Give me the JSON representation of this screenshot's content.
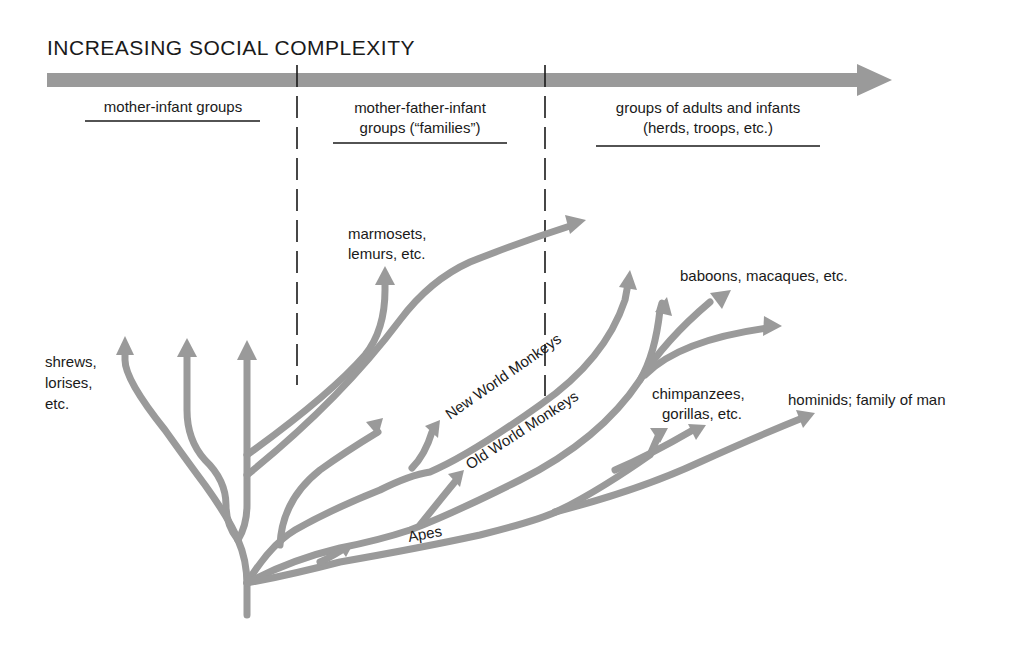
{
  "title": "INCREASING SOCIAL COMPLEXITY",
  "colors": {
    "arrow_gray": "#9a9a9a",
    "text": "#1a1a1a",
    "background": "#ffffff"
  },
  "categories": [
    {
      "line1": "mother-infant groups",
      "line2": ""
    },
    {
      "line1": "mother-father-infant",
      "line2": "groups (“families”)"
    },
    {
      "line1": "groups of adults and infants",
      "line2": "(herds, troops, etc.)"
    }
  ],
  "labels": {
    "shrews": [
      "shrews,",
      "lorises,",
      "etc."
    ],
    "marmosets": [
      "marmosets,",
      "lemurs, etc."
    ],
    "baboons": "baboons, macaques, etc.",
    "chimps": [
      "chimpanzees,",
      "gorillas, etc."
    ],
    "hominids": "hominids; family of man",
    "new_world": "New World Monkeys",
    "old_world": "Old World Monkeys",
    "apes": "Apes"
  }
}
